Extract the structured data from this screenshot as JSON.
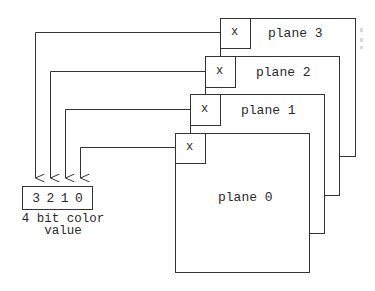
{
  "diagram": {
    "planes": [
      {
        "label": "plane 0",
        "pixel_label": "x"
      },
      {
        "label": "plane 1",
        "pixel_label": "x"
      },
      {
        "label": "plane 2",
        "pixel_label": "x"
      },
      {
        "label": "plane 3",
        "pixel_label": "x"
      }
    ],
    "register": {
      "bits": [
        "3",
        "2",
        "1",
        "0"
      ],
      "caption_line1": "4 bit color",
      "caption_line2": "value"
    },
    "colors": {
      "line": "#333333",
      "text": "#2a2a2a",
      "background": "#ffffff"
    }
  }
}
